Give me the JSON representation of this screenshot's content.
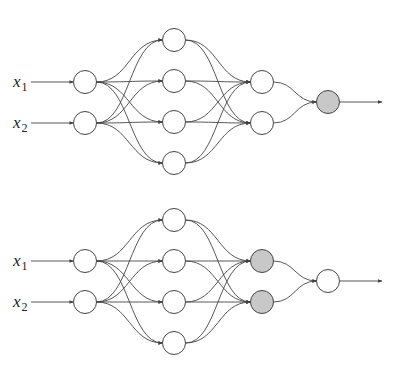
{
  "colors": {
    "background": "#ffffff",
    "stroke": "#444444",
    "highlight": "#c8c8c8",
    "plain": "#ffffff"
  },
  "networks": [
    {
      "name": "top-network",
      "inputs": [
        {
          "label": "x",
          "sub": "1",
          "y": 82
        },
        {
          "label": "x",
          "sub": "2",
          "y": 123
        }
      ],
      "layers": [
        {
          "x": 85,
          "ys": [
            82,
            123
          ],
          "highlight": [
            false,
            false
          ]
        },
        {
          "x": 174,
          "ys": [
            40,
            81,
            122,
            163
          ],
          "highlight": [
            false,
            false,
            false,
            false
          ]
        },
        {
          "x": 262,
          "ys": [
            82,
            123
          ],
          "highlight": [
            false,
            false
          ]
        },
        {
          "x": 328,
          "ys": [
            102
          ],
          "highlight": [
            true
          ]
        }
      ],
      "output_arrow_end": 382
    },
    {
      "name": "bottom-network",
      "inputs": [
        {
          "label": "x",
          "sub": "1",
          "y": 261
        },
        {
          "label": "x",
          "sub": "2",
          "y": 302
        }
      ],
      "layers": [
        {
          "x": 85,
          "ys": [
            261,
            302
          ],
          "highlight": [
            false,
            false
          ]
        },
        {
          "x": 174,
          "ys": [
            220,
            261,
            302,
            343
          ],
          "highlight": [
            false,
            false,
            false,
            false
          ]
        },
        {
          "x": 262,
          "ys": [
            261,
            302
          ],
          "highlight": [
            true,
            true
          ]
        },
        {
          "x": 328,
          "ys": [
            281
          ],
          "highlight": [
            false
          ]
        }
      ],
      "output_arrow_end": 382
    }
  ]
}
